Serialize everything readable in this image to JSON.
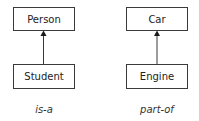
{
  "diagrams": [
    {
      "parent": "Person",
      "child": "Student",
      "relation": "is-a"
    },
    {
      "parent": "Car",
      "child": "Engine",
      "relation": "part-of"
    }
  ],
  "colors": {
    "stroke": "#3a3a3a",
    "text": "#222222",
    "background": "#ffffff"
  }
}
